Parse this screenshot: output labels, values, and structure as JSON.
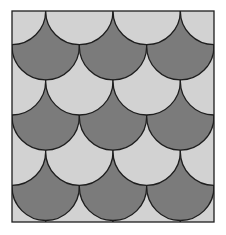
{
  "figure": {
    "type": "fish-scale tessellation",
    "frame": {
      "x": 12,
      "y": 11,
      "width": 202,
      "height": 211
    },
    "columns": 3,
    "rows": 6,
    "colors": {
      "dark": "#7b7b7b",
      "light": "#d2d2d2",
      "outline": "#1e1e1e",
      "background": "#ffffff"
    },
    "row_pattern": [
      "dark",
      "light",
      "dark",
      "light",
      "dark",
      "light"
    ],
    "stroke_width": 1.3
  }
}
